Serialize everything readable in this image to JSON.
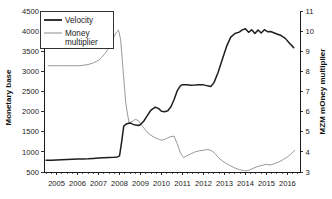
{
  "chart_data": {
    "type": "line",
    "title": "",
    "xlabel": "",
    "ylabel": "Monetary base",
    "y2label": "MZM mOney multiplier",
    "grid": false,
    "legend_position": "top-left",
    "xlim": [
      2004.4,
      2016.6
    ],
    "ylim": [
      500,
      4500
    ],
    "y2lim": [
      3,
      11
    ],
    "ytick_labels": [
      "4500",
      "4000",
      "3500",
      "3000",
      "2500",
      "2000",
      "1500",
      "1000",
      "500"
    ],
    "ytick_values": [
      4500,
      4000,
      3500,
      3000,
      2500,
      2000,
      1500,
      1000,
      500
    ],
    "y2tick_labels": [
      "11",
      "10",
      "9",
      "8",
      "7",
      "6",
      "5",
      "4",
      "3"
    ],
    "y2tick_values": [
      11,
      10,
      9,
      8,
      7,
      6,
      5,
      4,
      3
    ],
    "xtick_labels": [
      "2005",
      "2006",
      "2007",
      "2008",
      "2009",
      "2010",
      "2011",
      "2012",
      "2013",
      "2014",
      "2015",
      "2016"
    ],
    "xtick_values": [
      2005,
      2006,
      2007,
      2008,
      2009,
      2010,
      2011,
      2012,
      2013,
      2014,
      2015,
      2016
    ],
    "series": [
      {
        "name": "Velocity",
        "axis": "left",
        "color": "#1e1e1e",
        "x": [
          2004.5,
          2004.75,
          2005.0,
          2005.25,
          2005.5,
          2005.75,
          2006.0,
          2006.25,
          2006.5,
          2006.75,
          2007.0,
          2007.25,
          2007.5,
          2007.75,
          2007.9,
          2008.0,
          2008.1,
          2008.2,
          2008.35,
          2008.5,
          2008.62,
          2008.75,
          2008.9,
          2009.0,
          2009.15,
          2009.3,
          2009.5,
          2009.7,
          2009.85,
          2010.0,
          2010.15,
          2010.3,
          2010.45,
          2010.6,
          2010.75,
          2010.9,
          2011.0,
          2011.2,
          2011.4,
          2011.6,
          2011.8,
          2012.0,
          2012.2,
          2012.35,
          2012.5,
          2012.7,
          2012.9,
          2013.1,
          2013.3,
          2013.5,
          2013.7,
          2013.85,
          2014.0,
          2014.15,
          2014.3,
          2014.45,
          2014.6,
          2014.75,
          2014.9,
          2015.05,
          2015.2,
          2015.35,
          2015.5,
          2015.7,
          2015.9,
          2016.1,
          2016.3
        ],
        "y": [
          790,
          795,
          800,
          805,
          810,
          815,
          820,
          825,
          830,
          838,
          845,
          852,
          860,
          868,
          875,
          900,
          1250,
          1640,
          1700,
          1720,
          1690,
          1665,
          1655,
          1680,
          1760,
          1880,
          2040,
          2110,
          2080,
          2010,
          1995,
          2020,
          2120,
          2300,
          2520,
          2640,
          2670,
          2665,
          2655,
          2660,
          2670,
          2665,
          2640,
          2625,
          2720,
          2980,
          3300,
          3620,
          3850,
          3940,
          3975,
          4030,
          4060,
          3970,
          4035,
          3940,
          4030,
          3955,
          4035,
          3985,
          3990,
          3960,
          3930,
          3890,
          3820,
          3700,
          3590
        ]
      },
      {
        "name": "Money multiplier",
        "axis": "right",
        "color": "#8d8d8d",
        "x": [
          2004.6,
          2004.8,
          2005.0,
          2005.25,
          2005.5,
          2005.75,
          2006.0,
          2006.25,
          2006.5,
          2006.75,
          2007.0,
          2007.15,
          2007.3,
          2007.45,
          2007.6,
          2007.75,
          2007.85,
          2007.95,
          2008.05,
          2008.15,
          2008.3,
          2008.45,
          2008.6,
          2008.75,
          2008.9,
          2009.0,
          2009.15,
          2009.3,
          2009.5,
          2009.7,
          2009.9,
          2010.0,
          2010.15,
          2010.3,
          2010.45,
          2010.6,
          2010.75,
          2010.9,
          2011.05,
          2011.2,
          2011.4,
          2011.6,
          2011.8,
          2012.0,
          2012.2,
          2012.4,
          2012.55,
          2012.7,
          2012.9,
          2013.1,
          2013.3,
          2013.5,
          2013.7,
          2013.9,
          2014.05,
          2014.2,
          2014.4,
          2014.6,
          2014.8,
          2015.0,
          2015.2,
          2015.4,
          2015.6,
          2015.8,
          2016.0,
          2016.2,
          2016.35
        ],
        "y": [
          8.28,
          8.28,
          8.28,
          8.28,
          8.28,
          8.28,
          8.28,
          8.3,
          8.34,
          8.42,
          8.55,
          8.7,
          8.88,
          9.1,
          9.4,
          9.75,
          9.95,
          10.05,
          9.6,
          8.3,
          6.4,
          5.45,
          5.5,
          5.62,
          5.55,
          5.4,
          5.2,
          5.0,
          4.82,
          4.7,
          4.62,
          4.58,
          4.62,
          4.7,
          4.76,
          4.78,
          4.4,
          3.95,
          3.72,
          3.8,
          3.9,
          4.0,
          4.05,
          4.08,
          4.12,
          4.05,
          3.92,
          3.72,
          3.55,
          3.42,
          3.3,
          3.2,
          3.12,
          3.07,
          3.06,
          3.1,
          3.2,
          3.28,
          3.33,
          3.38,
          3.35,
          3.42,
          3.5,
          3.62,
          3.75,
          3.92,
          4.08
        ]
      }
    ]
  },
  "legend": {
    "entries": [
      {
        "label": "Velocity",
        "style": "thick-dark"
      },
      {
        "label": "Money multiplier",
        "style": "thin-gray",
        "line1": "Money",
        "line2": "multiplier"
      }
    ]
  },
  "axes": {
    "left_title": "Monetary base",
    "right_title": "MZM mOney multiplier"
  }
}
